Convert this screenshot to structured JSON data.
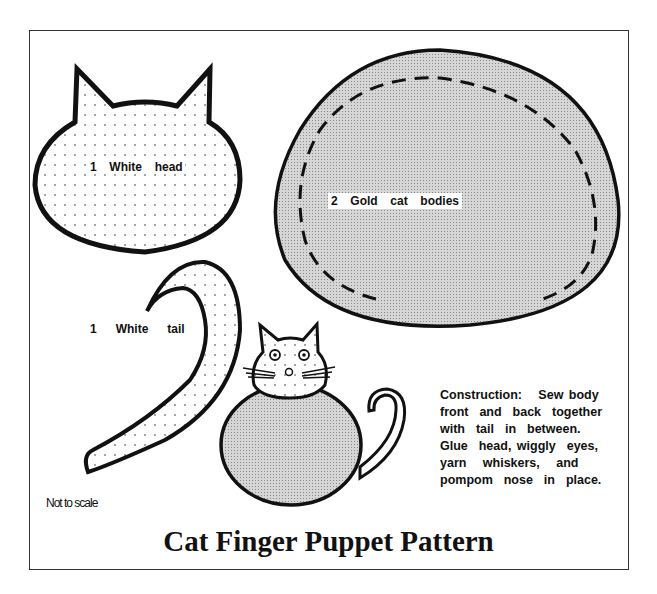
{
  "title": "Cat Finger Puppet Pattern",
  "note": "Not to scale",
  "pieces": {
    "head": {
      "label": "1  White  head",
      "fill": "dotted white"
    },
    "body": {
      "label": "2  Gold  cat  bodies",
      "fill": "gray screen"
    },
    "tail": {
      "label": "1   White   tail",
      "fill": "dotted white"
    }
  },
  "instructions": [
    "Construction:   Sew body",
    "front  and  back  together",
    "with  tail  in  between.",
    "Glue  head, wiggly  eyes,",
    "yarn   whiskers,   and",
    "pompom  nose  in  place."
  ],
  "colors": {
    "outline": "#111111",
    "gold_fill": "#c8c8c8",
    "frame": "#333333"
  }
}
